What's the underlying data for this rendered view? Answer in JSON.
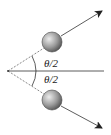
{
  "diagram": {
    "labels": {
      "upper_angle": "θ/2",
      "lower_angle": "θ/2"
    },
    "colors": {
      "line": "#333333",
      "ball_light": "#e8e8e8",
      "ball_dark": "#6a6a6a"
    }
  }
}
